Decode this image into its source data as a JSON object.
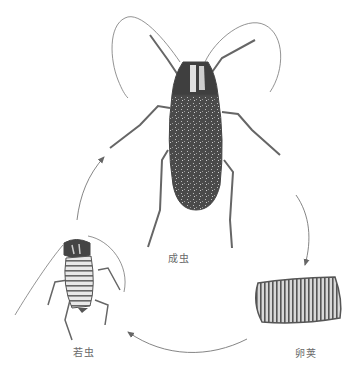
{
  "diagram": {
    "type": "life-cycle",
    "stages": [
      {
        "id": "adult",
        "label": "成虫"
      },
      {
        "id": "ootheca",
        "label": "卵荚"
      },
      {
        "id": "nymph",
        "label": "若虫"
      }
    ],
    "arrows": [
      {
        "from": "adult",
        "to": "ootheca"
      },
      {
        "from": "ootheca",
        "to": "nymph"
      },
      {
        "from": "nymph",
        "to": "adult"
      }
    ]
  },
  "colors": {
    "ink": "#555555",
    "body_fill": "#4a4a4a",
    "line": "#777777",
    "label": "#6a6a6a",
    "background": "#ffffff"
  }
}
